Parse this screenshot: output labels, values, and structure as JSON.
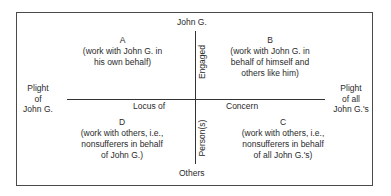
{
  "diagram": {
    "axis_labels": {
      "top": "John G.",
      "bottom": "Others",
      "left": [
        "Plight",
        "of",
        "John G."
      ],
      "right": [
        "Plight",
        "of all",
        "John G.'s"
      ],
      "horizontal_left": "Locus of",
      "horizontal_right": "Concern",
      "vertical_upper": "Engaged",
      "vertical_lower": "Person(s)"
    },
    "quadrants": {
      "A": {
        "letter": "A",
        "lines": [
          "(work with John G. in",
          "his own behalf)"
        ]
      },
      "B": {
        "letter": "B",
        "lines": [
          "(work with John G. in",
          "behalf of himself and",
          "others like him)"
        ]
      },
      "C": {
        "letter": "C",
        "lines": [
          "(work with others, i.e.,",
          "nonsufferers in behalf",
          "of all John G.'s)"
        ]
      },
      "D": {
        "letter": "D",
        "lines": [
          "(work with others, i.e.,",
          "nonsufferers in behalf",
          "of John G.)"
        ]
      }
    },
    "colors": {
      "line": "#333333",
      "text": "#2a2a2a",
      "background": "#ffffff"
    }
  }
}
